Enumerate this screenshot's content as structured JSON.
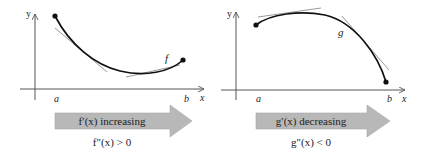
{
  "panels": [
    {
      "id": "left",
      "function_label": "f",
      "axis_y": "y",
      "axis_x": "x",
      "tick_a": "a",
      "tick_b": "b",
      "arrow_text": "f′(x) increasing",
      "caption": "f″(x) > 0",
      "description": "concave up curve with tangent lines"
    },
    {
      "id": "right",
      "function_label": "g",
      "axis_y": "y",
      "axis_x": "x",
      "tick_a": "a",
      "tick_b": "b",
      "arrow_text": "g′(x) decreasing",
      "caption": "g″(x) < 0",
      "description": "concave down curve with tangent lines"
    }
  ],
  "colors": {
    "curve": "#111111",
    "tangent": "#9a9a9a",
    "axis": "#555555",
    "arrow_fill": "#b8b8b8",
    "arrow_stroke": "#a8a8a8"
  }
}
